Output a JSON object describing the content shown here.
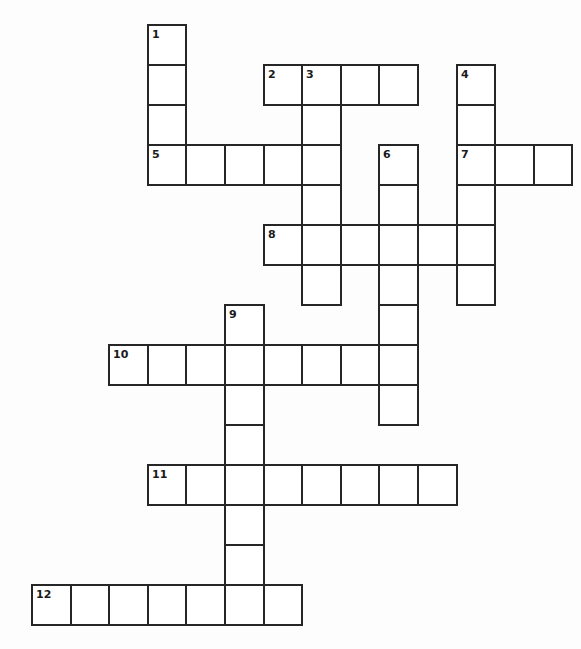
{
  "puzzle": {
    "type": "crossword",
    "grid": {
      "cols": 14,
      "rows": 15,
      "origin_x": 32,
      "origin_y": 25,
      "cell_w": 38.6,
      "cell_h": 40
    },
    "colors": {
      "background": "#ffffff",
      "line": "#262626",
      "number": "#1a1a1a"
    },
    "entries": [
      {
        "number": "1",
        "direction": "down",
        "row": 0,
        "col": 3,
        "length": 4,
        "answer": ""
      },
      {
        "number": "2",
        "direction": "across",
        "row": 1,
        "col": 6,
        "length": 4,
        "answer": ""
      },
      {
        "number": "3",
        "direction": "down",
        "row": 1,
        "col": 7,
        "length": 6,
        "answer": ""
      },
      {
        "number": "4",
        "direction": "down",
        "row": 1,
        "col": 11,
        "length": 6,
        "answer": ""
      },
      {
        "number": "5",
        "direction": "across",
        "row": 3,
        "col": 3,
        "length": 5,
        "answer": ""
      },
      {
        "number": "6",
        "direction": "down",
        "row": 3,
        "col": 9,
        "length": 7,
        "answer": ""
      },
      {
        "number": "7",
        "direction": "across",
        "row": 3,
        "col": 11,
        "length": 3,
        "answer": ""
      },
      {
        "number": "8",
        "direction": "across",
        "row": 5,
        "col": 6,
        "length": 6,
        "answer": ""
      },
      {
        "number": "9",
        "direction": "down",
        "row": 7,
        "col": 5,
        "length": 8,
        "answer": ""
      },
      {
        "number": "10",
        "direction": "across",
        "row": 8,
        "col": 2,
        "length": 8,
        "answer": ""
      },
      {
        "number": "11",
        "direction": "across",
        "row": 11,
        "col": 3,
        "length": 8,
        "answer": ""
      },
      {
        "number": "12",
        "direction": "across",
        "row": 14,
        "col": 0,
        "length": 7,
        "answer": ""
      }
    ]
  }
}
